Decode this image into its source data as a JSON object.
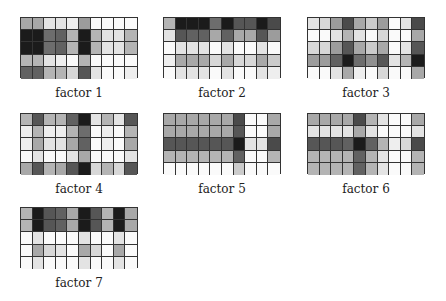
{
  "figure": {
    "grid": {
      "rows": 5,
      "cols": 10
    },
    "factors": [
      {
        "label": "factor 1",
        "x": 20,
        "y": 17,
        "values": [
          [
            0.35,
            0.35,
            0.1,
            0.1,
            0.05,
            0.4,
            0,
            0,
            0,
            0
          ],
          [
            0.95,
            0.95,
            0.6,
            0.65,
            0.3,
            0.95,
            0.3,
            0.1,
            0.1,
            0.3
          ],
          [
            0.95,
            0.95,
            0.6,
            0.65,
            0.3,
            0.95,
            0.3,
            0.1,
            0.1,
            0.3
          ],
          [
            0.3,
            0.3,
            0.1,
            0.05,
            0,
            0.3,
            0,
            0,
            0,
            0
          ],
          [
            0.65,
            0.65,
            0.3,
            0.3,
            0.15,
            0.7,
            0.1,
            0,
            0,
            0.05
          ]
        ]
      },
      {
        "label": "factor 2",
        "x": 163,
        "y": 17,
        "values": [
          [
            0.3,
            0.95,
            0.95,
            0.95,
            0.6,
            0.95,
            0.7,
            0.7,
            0.95,
            0.75
          ],
          [
            0.1,
            0.7,
            0.65,
            0.65,
            0.35,
            0.65,
            0.35,
            0.35,
            0.7,
            0.4
          ],
          [
            0,
            0.1,
            0.1,
            0.1,
            0,
            0.1,
            0,
            0,
            0.1,
            0
          ],
          [
            0.05,
            0.35,
            0.35,
            0.35,
            0.15,
            0.35,
            0.15,
            0.15,
            0.35,
            0.2
          ],
          [
            0,
            0.1,
            0.1,
            0.1,
            0,
            0.1,
            0,
            0,
            0.1,
            0.05
          ]
        ]
      },
      {
        "label": "factor 3",
        "x": 307,
        "y": 17,
        "values": [
          [
            0.1,
            0.15,
            0.4,
            0.75,
            0.35,
            0.2,
            0.4,
            0,
            0.1,
            0.75
          ],
          [
            0,
            0,
            0.1,
            0.3,
            0.1,
            0,
            0.15,
            0,
            0,
            0.35
          ],
          [
            0.15,
            0.15,
            0.4,
            0.7,
            0.35,
            0.2,
            0.35,
            0,
            0.1,
            0.7
          ],
          [
            0.4,
            0.4,
            0.65,
            0.95,
            0.6,
            0.45,
            0.7,
            0.1,
            0.3,
            0.95
          ],
          [
            0,
            0,
            0.1,
            0.35,
            0.05,
            0,
            0.15,
            0,
            0,
            0.35
          ]
        ]
      },
      {
        "label": "factor 4",
        "x": 20,
        "y": 113,
        "values": [
          [
            0.3,
            0.7,
            0.3,
            0.3,
            0.65,
            0.95,
            0.1,
            0.3,
            0.1,
            0.7
          ],
          [
            0.05,
            0.3,
            0.05,
            0.05,
            0.3,
            0.6,
            0,
            0.05,
            0,
            0.3
          ],
          [
            0.05,
            0.35,
            0.1,
            0.1,
            0.35,
            0.65,
            0,
            0.05,
            0,
            0.35
          ],
          [
            0,
            0.1,
            0,
            0,
            0.1,
            0.35,
            0,
            0,
            0,
            0.1
          ],
          [
            0.35,
            0.7,
            0.3,
            0.35,
            0.7,
            0.95,
            0.15,
            0.3,
            0.15,
            0.7
          ]
        ]
      },
      {
        "label": "factor 5",
        "x": 163,
        "y": 113,
        "values": [
          [
            0.35,
            0.35,
            0.35,
            0.35,
            0.35,
            0.35,
            0.75,
            0,
            0,
            0.35
          ],
          [
            0.35,
            0.35,
            0.35,
            0.35,
            0.35,
            0.35,
            0.7,
            0,
            0,
            0.35
          ],
          [
            0.7,
            0.7,
            0.7,
            0.7,
            0.7,
            0.7,
            0.95,
            0.1,
            0.1,
            0.75
          ],
          [
            0.3,
            0.3,
            0.3,
            0.3,
            0.3,
            0.3,
            0.65,
            0,
            0,
            0.3
          ],
          [
            0,
            0,
            0,
            0,
            0,
            0,
            0.2,
            0,
            0,
            0
          ]
        ]
      },
      {
        "label": "factor 6",
        "x": 307,
        "y": 113,
        "values": [
          [
            0.35,
            0.35,
            0.35,
            0.35,
            0.75,
            0.3,
            0.1,
            0,
            0,
            0.35
          ],
          [
            0.1,
            0.1,
            0.1,
            0.1,
            0.35,
            0.1,
            0,
            0,
            0,
            0.1
          ],
          [
            0.7,
            0.7,
            0.7,
            0.65,
            0.95,
            0.65,
            0.3,
            0.05,
            0.15,
            0.75
          ],
          [
            0.3,
            0.3,
            0.3,
            0.3,
            0.65,
            0.3,
            0.1,
            0,
            0,
            0.3
          ],
          [
            0.3,
            0.3,
            0.3,
            0.3,
            0.65,
            0.3,
            0.1,
            0,
            0,
            0.3
          ]
        ]
      },
      {
        "label": "factor 7",
        "x": 20,
        "y": 207,
        "values": [
          [
            0.3,
            0.95,
            0.7,
            0.65,
            0.35,
            0.95,
            0.7,
            0.3,
            0.95,
            0.35
          ],
          [
            0.3,
            0.95,
            0.7,
            0.65,
            0.35,
            0.95,
            0.7,
            0.3,
            0.95,
            0.35
          ],
          [
            0,
            0.1,
            0,
            0,
            0,
            0.1,
            0,
            0,
            0.1,
            0
          ],
          [
            0,
            0.35,
            0.15,
            0.1,
            0,
            0.35,
            0.15,
            0,
            0.35,
            0
          ],
          [
            0,
            0.1,
            0,
            0,
            0,
            0.1,
            0,
            0,
            0.1,
            0
          ]
        ]
      }
    ]
  }
}
